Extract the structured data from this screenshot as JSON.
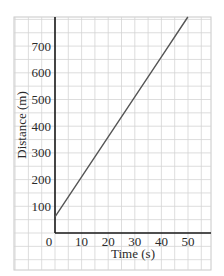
{
  "chart_data": {
    "type": "line",
    "title": "",
    "xlabel": "Time (s)",
    "ylabel": "Distance (m)",
    "xlim": [
      -15,
      60
    ],
    "ylim": [
      -140,
      790
    ],
    "x_ticks": [
      0,
      10,
      20,
      30,
      40,
      50
    ],
    "y_ticks": [
      100,
      200,
      300,
      400,
      500,
      600,
      700
    ],
    "x_tick_labels": [
      "0",
      "10",
      "20",
      "30",
      "40",
      "50"
    ],
    "y_tick_labels": [
      "100",
      "200",
      "300",
      "400",
      "500",
      "600",
      "700"
    ],
    "grid": true,
    "legend": null,
    "series": [
      {
        "name": "distance",
        "x": [
          0,
          10,
          20,
          30,
          40,
          50
        ],
        "y": [
          60,
          210,
          360,
          510,
          660,
          810
        ],
        "color": "#555555"
      }
    ]
  },
  "colors": {
    "grid": "#d4d4d4",
    "axis": "#1a1a1a",
    "line": "#555555",
    "border": "#c8c8c8"
  }
}
